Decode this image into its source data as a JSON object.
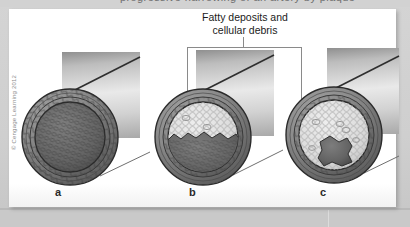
{
  "page": {
    "background_color": "#c9c9c9",
    "panel_color": "#ffffff",
    "cut_off_top_text": "progressive narrowing of an artery by plaque"
  },
  "figure": {
    "credit": "© Cengage Learning 2012",
    "caption": {
      "line1": "Fatty deposits and",
      "line2": "cellular debris"
    },
    "leader": {
      "color": "#8a8a8a",
      "style": "bracket",
      "points_to": [
        "vessel-b",
        "vessel-c"
      ]
    },
    "panels": [
      {
        "id": "a",
        "label": "a",
        "description": "normal artery, open lumen",
        "lumen_fill_percent": 0,
        "plaque_color": "#d8d8d8",
        "lumen_color": "#6b6b6b",
        "wall_color": "#7a7a7a"
      },
      {
        "id": "b",
        "label": "b",
        "description": "artery partially narrowed by plaque",
        "lumen_fill_percent": 45,
        "plaque_color": "#dcdcdc",
        "lumen_color": "#6b6b6b",
        "wall_color": "#7a7a7a"
      },
      {
        "id": "c",
        "label": "c",
        "description": "artery severely narrowed by plaque",
        "lumen_fill_percent": 80,
        "plaque_color": "#dcdcdc",
        "lumen_color": "#5f5f5f",
        "wall_color": "#7a7a7a"
      }
    ]
  }
}
